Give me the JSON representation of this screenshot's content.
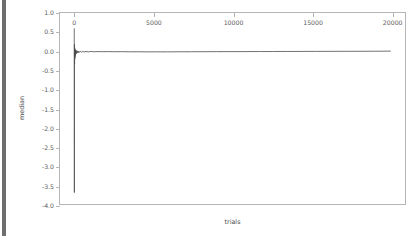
{
  "window": {
    "background_color": "#ffffff",
    "scrollbar": {
      "name": "vertical-scrollbar",
      "thumb_color": "#6e6e6e",
      "track_color": "#ffffff"
    }
  },
  "chart_data": {
    "type": "line",
    "title": "",
    "xlabel": "trials",
    "ylabel": "median",
    "xlim": [
      -900,
      20900
    ],
    "ylim": [
      -4.0,
      1.0
    ],
    "grid": false,
    "legend": null,
    "line_color": "#4d4d4d",
    "xticks": [
      0,
      5000,
      10000,
      15000,
      20000
    ],
    "xtick_labels": [
      "0",
      "5000",
      "10000",
      "15000",
      "20000"
    ],
    "yticks": [
      1.0,
      0.5,
      0.0,
      -0.5,
      -1.0,
      -1.5,
      -2.0,
      -2.5,
      -3.0,
      -3.5,
      -4.0
    ],
    "ytick_labels": [
      "1.0",
      "0.5",
      "0.0",
      "-0.5",
      "-1.0",
      "-1.5",
      "-2.0",
      "-2.5",
      "-3.0",
      "-3.5",
      "-4.0"
    ],
    "series": [
      {
        "name": "median",
        "x": [
          0,
          8,
          14,
          20,
          26,
          32,
          38,
          45,
          52,
          60,
          70,
          82,
          95,
          110,
          130,
          155,
          185,
          220,
          260,
          310,
          370,
          440,
          520,
          620,
          740,
          880,
          1050,
          1250,
          1500,
          1800,
          2150,
          2550,
          3000,
          3500,
          4000,
          4600,
          5200,
          5900,
          6600,
          7400,
          8200,
          9000,
          9900,
          10800,
          11700,
          12600,
          13500,
          14400,
          15300,
          16200,
          17100,
          18000,
          18900,
          19500,
          20000
        ],
        "y": [
          0.6,
          -3.7,
          0.18,
          -0.34,
          0.09,
          -0.21,
          0.06,
          -0.16,
          0.04,
          -0.12,
          0.03,
          -0.09,
          0.02,
          -0.07,
          0.015,
          -0.055,
          0.01,
          -0.045,
          0.005,
          -0.035,
          0.0,
          -0.028,
          -0.004,
          -0.022,
          -0.006,
          -0.018,
          -0.008,
          -0.014,
          -0.01,
          -0.013,
          -0.011,
          -0.014,
          -0.012,
          -0.016,
          -0.014,
          -0.018,
          -0.016,
          -0.017,
          -0.015,
          -0.014,
          -0.013,
          -0.012,
          -0.011,
          -0.01,
          -0.009,
          -0.008,
          -0.007,
          -0.006,
          -0.005,
          -0.004,
          -0.003,
          -0.002,
          -0.001,
          0.0,
          0.002
        ]
      }
    ],
    "annotations": [
      {
        "text": "sharp initial transient spike near trials=0 spanning approximately +0.6 to -3.7, then rapid convergence to ~0.0"
      }
    ]
  }
}
